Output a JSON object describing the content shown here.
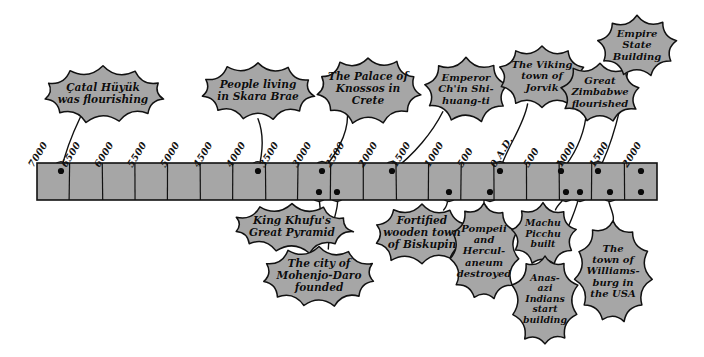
{
  "figure": {
    "colors": {
      "bubble_fill": "#a6a6a6",
      "bubble_stroke": "#111111",
      "bar_fill": "#a6a6a6",
      "bar_stroke": "#111111",
      "dot": "#0a0a0a",
      "background": "#ffffff",
      "text": "#0d0d0d"
    }
  },
  "axis": {
    "name": "timeline-axis",
    "orientation": "horizontal",
    "start_label": "7000",
    "end_label": "2000",
    "era_marker": "0 A.D.",
    "ticks": [
      {
        "label": "7000",
        "x": 37
      },
      {
        "label": "6500",
        "x": 70
      },
      {
        "label": "6000",
        "x": 103
      },
      {
        "label": "5500",
        "x": 136
      },
      {
        "label": "5000",
        "x": 169
      },
      {
        "label": "4500",
        "x": 202
      },
      {
        "label": "4000",
        "x": 235
      },
      {
        "label": "3500",
        "x": 268
      },
      {
        "label": "3000",
        "x": 301
      },
      {
        "label": "2500",
        "x": 334
      },
      {
        "label": "2000",
        "x": 367
      },
      {
        "label": "1500",
        "x": 400
      },
      {
        "label": "1000",
        "x": 433
      },
      {
        "label": "500",
        "x": 466
      },
      {
        "label": "0 A.D.",
        "x": 499
      },
      {
        "label": "500",
        "x": 532
      },
      {
        "label": "1000",
        "x": 565
      },
      {
        "label": "1500",
        "x": 598
      },
      {
        "label": "2000",
        "x": 631
      }
    ]
  },
  "bar": {
    "name": "timeline-bar",
    "left": 37,
    "right": 657,
    "top": 163,
    "bottom": 200,
    "segments": 19
  },
  "events_above": [
    {
      "id": "catal-huyuk",
      "text": "Çatal Hüyük\nwas flourishing",
      "dot": {
        "x": 61,
        "y": 171
      },
      "bubble": {
        "cx": 103,
        "cy": 95,
        "w": 118,
        "h": 56
      }
    },
    {
      "id": "skara-brae",
      "text": "People living\nin Skara Brae",
      "dot": {
        "x": 258,
        "y": 171
      },
      "bubble": {
        "cx": 258,
        "cy": 92,
        "w": 110,
        "h": 58
      }
    },
    {
      "id": "knossos",
      "text": "The Palace of\nKnossos in\nCrete",
      "dot": {
        "x": 322,
        "y": 171
      },
      "bubble": {
        "cx": 368,
        "cy": 90,
        "w": 104,
        "h": 66
      }
    },
    {
      "id": "chin-shi-huang-ti",
      "text": "Emperor\nCh'in Shi-\nhuang-ti",
      "dot": {
        "x": 392,
        "y": 171
      },
      "bubble": {
        "cx": 466,
        "cy": 90,
        "w": 86,
        "h": 64
      }
    },
    {
      "id": "jorvik",
      "text": "The Viking\ntown of\nJorvik",
      "dot": {
        "x": 500,
        "y": 171
      },
      "bubble": {
        "cx": 542,
        "cy": 77,
        "w": 88,
        "h": 64
      }
    },
    {
      "id": "great-zimbabwe",
      "text": "Great\nZimbabwe\nflourished",
      "dot": {
        "x": 561,
        "y": 171
      },
      "bubble": {
        "cx": 600,
        "cy": 93,
        "w": 80,
        "h": 62
      }
    },
    {
      "id": "empire-state-building",
      "text": "Empire\nState\nBuilding",
      "dot": {
        "x": 598,
        "y": 171
      },
      "bubble": {
        "cx": 637,
        "cy": 46,
        "w": 80,
        "h": 62
      }
    },
    {
      "id": "unlabelled-dot-2000",
      "text": "",
      "dot": {
        "x": 641,
        "y": 171
      },
      "bubble": null
    }
  ],
  "events_below": [
    {
      "id": "khufu-pyramid",
      "text": "King Khufu's\nGreat Pyramid",
      "dot": {
        "x": 319,
        "y": 192
      },
      "bubble": {
        "cx": 292,
        "cy": 228,
        "w": 118,
        "h": 50
      }
    },
    {
      "id": "mohenjo-daro",
      "text": "The city of\nMohenjo-Daro\nfounded",
      "dot": {
        "x": 337,
        "y": 192
      },
      "bubble": {
        "cx": 319,
        "cy": 277,
        "w": 112,
        "h": 62
      }
    },
    {
      "id": "biskupin",
      "text": "Fortified\nwooden town\nof Biskupin",
      "dot": {
        "x": 449,
        "y": 192
      },
      "bubble": {
        "cx": 422,
        "cy": 234,
        "w": 100,
        "h": 62
      }
    },
    {
      "id": "pompeii",
      "text": "Pompeii\nand\nHercul-\naneum\ndestroyed",
      "dot": {
        "x": 490,
        "y": 192
      },
      "bubble": {
        "cx": 484,
        "cy": 252,
        "w": 72,
        "h": 98
      }
    },
    {
      "id": "machu-picchu",
      "text": "Machu\nPicchu\nbuilt",
      "dot": {
        "x": 566,
        "y": 192
      },
      "bubble": {
        "cx": 543,
        "cy": 235,
        "w": 66,
        "h": 62
      }
    },
    {
      "id": "anasazi",
      "text": "Anas-\nazi\nIndians\nstart\nbuilding",
      "dot": {
        "x": 580,
        "y": 192
      },
      "bubble": {
        "cx": 545,
        "cy": 300,
        "w": 66,
        "h": 92
      }
    },
    {
      "id": "williamsburg",
      "text": "The\ntown of\nWilliams-\nburg in\nthe USA",
      "dot": {
        "x": 610,
        "y": 192
      },
      "bubble": {
        "cx": 613,
        "cy": 272,
        "w": 76,
        "h": 100
      }
    },
    {
      "id": "unlabelled-dot-lower",
      "text": "",
      "dot": {
        "x": 641,
        "y": 192
      },
      "bubble": null
    }
  ]
}
